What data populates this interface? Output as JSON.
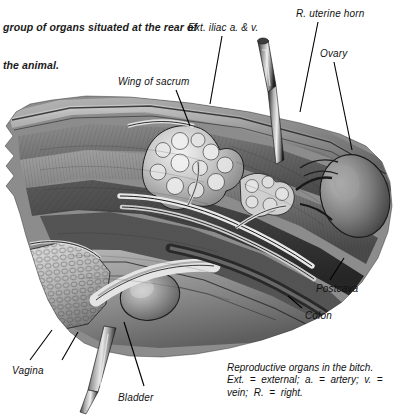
{
  "page": {
    "width": 403,
    "height": 417,
    "background": "#ffffff",
    "ink": "#111111"
  },
  "intro_text": {
    "line1": "group of organs situated at the rear of",
    "line2": "the animal."
  },
  "figure": {
    "title": "Reproductive organs in the bitch.",
    "style": "grayscale-halftone-illustration",
    "labels": [
      {
        "id": "ext-iliac",
        "text": "Ext. iliac a. & v.",
        "x": 188,
        "y": 22
      },
      {
        "id": "r-uterine-horn",
        "text": "R. uterine horn",
        "x": 296,
        "y": 8
      },
      {
        "id": "ovary",
        "text": "Ovary",
        "x": 320,
        "y": 48
      },
      {
        "id": "wing-of-sacrum",
        "text": "Wing of sacrum",
        "x": 118,
        "y": 76
      },
      {
        "id": "postcava",
        "text": "Postcava",
        "x": 316,
        "y": 283
      },
      {
        "id": "colon",
        "text": "Colon",
        "x": 305,
        "y": 310
      },
      {
        "id": "vagina",
        "text": "Vagina",
        "x": 12,
        "y": 365
      },
      {
        "id": "bladder",
        "text": "Bladder",
        "x": 118,
        "y": 392
      }
    ],
    "caption": {
      "line1": "Reproductive organs in the bitch.",
      "line2": "Ext.  =  external;  a.  =  artery;  v.  =",
      "line3": "vein;  R.  =  right."
    },
    "abbreviations": [
      {
        "short": "Ext.",
        "meaning": "external"
      },
      {
        "short": "a.",
        "meaning": "artery"
      },
      {
        "short": "v.",
        "meaning": "vein"
      },
      {
        "short": "R.",
        "meaning": "right"
      }
    ],
    "instruments": [
      {
        "id": "upper-probe",
        "description": "surgical probe entering from top"
      },
      {
        "id": "lower-probe",
        "description": "surgical probe exiting bottom left"
      }
    ],
    "colors": {
      "ink": "#111111",
      "tissue_dark": "#3b3b3b",
      "tissue_mid": "#7d7d7d",
      "tissue_light": "#c9c9c9",
      "highlight": "#efefef"
    }
  }
}
